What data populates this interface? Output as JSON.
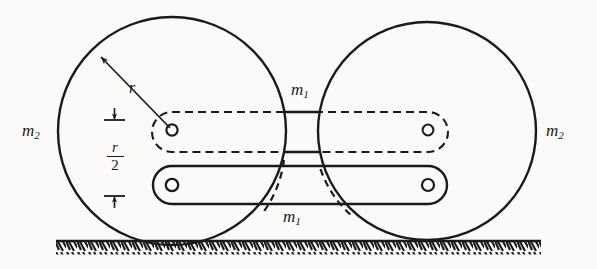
{
  "figure": {
    "background_color": "#fbfaf8",
    "ink_color": "#1a1a1a",
    "width": 597,
    "height": 269
  },
  "labels": {
    "mass_wheel_left": {
      "symbol": "m",
      "subscript": "2",
      "x": 22,
      "y": 121
    },
    "mass_wheel_right": {
      "symbol": "m",
      "subscript": "2",
      "x": 546,
      "y": 121
    },
    "mass_bar_upper": {
      "symbol": "m",
      "subscript": "1",
      "x": 291,
      "y": 80
    },
    "mass_bar_lower": {
      "symbol": "m",
      "subscript": "1",
      "x": 283,
      "y": 207
    },
    "radius": {
      "symbol": "r",
      "x": 129,
      "y": 79
    },
    "offset_numerator": "r",
    "offset_denominator": "2"
  },
  "geometry": {
    "wheel_left": {
      "cx": 172,
      "cy": 131,
      "r": 114
    },
    "wheel_right": {
      "cx": 427,
      "cy": 131,
      "r": 109
    },
    "hub_left_upper": {
      "cx": 172,
      "cy": 130,
      "r": 5.5
    },
    "hub_left_lower": {
      "cx": 172,
      "cy": 185,
      "r": 6
    },
    "hub_right_upper": {
      "cx": 428,
      "cy": 130,
      "r": 5.5
    },
    "hub_right_lower": {
      "cx": 428,
      "cy": 185,
      "r": 6
    },
    "bar_upper_dashed": {
      "x1": 172,
      "x2": 428,
      "top": 112,
      "bottom": 152,
      "style": "dashed"
    },
    "bar_lower_solid": {
      "x1": 172,
      "x2": 428,
      "top": 166,
      "bottom": 204,
      "style": "solid"
    },
    "ground_line_y": 241,
    "ground_x1": 56,
    "ground_x2": 541,
    "radius_arrow": {
      "from_x": 168,
      "from_y": 126,
      "to_x": 99,
      "to_y": 55
    },
    "dimension_line_x": 114,
    "dimension_top_y": 119,
    "dimension_bottom_y": 196
  },
  "icons": {
    "wheel": "circle-outline-icon",
    "hub": "pivot-hole-icon",
    "ground": "hatched-ground-icon",
    "radius_arrow": "radius-arrow-icon",
    "dimension": "dimension-arrow-icon"
  }
}
